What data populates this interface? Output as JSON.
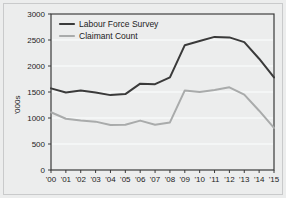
{
  "chart_data": {
    "type": "line",
    "title": "",
    "xlabel": "",
    "ylabel": "'000s",
    "ylim": [
      0,
      3000
    ],
    "yticks": [
      0,
      500,
      1000,
      1500,
      2000,
      2500,
      3000
    ],
    "ytick_labels": [
      "0",
      "500",
      "1000",
      "1500",
      "2000",
      "2500",
      "3000"
    ],
    "grid": "horizontal",
    "legend_position": "top-left",
    "categories": [
      "'00",
      "'01",
      "'02",
      "'03",
      "'04",
      "'05",
      "'06",
      "'07",
      "'08",
      "'09",
      "'10",
      "'11",
      "'12",
      "'13",
      "'14",
      "'15"
    ],
    "x": [
      2000,
      2001,
      2002,
      2003,
      2004,
      2005,
      2006,
      2007,
      2008,
      2009,
      2010,
      2011,
      2012,
      2013,
      2014,
      2015
    ],
    "series": [
      {
        "name": "Labour Force Survey",
        "color": "#3a3a3a",
        "values": [
          1570,
          1490,
          1530,
          1490,
          1440,
          1460,
          1660,
          1650,
          1780,
          2400,
          2480,
          2560,
          2550,
          2460,
          2140,
          1780
        ]
      },
      {
        "name": "Claimant Count",
        "color": "#a9abab",
        "values": [
          1110,
          985,
          950,
          930,
          865,
          870,
          950,
          870,
          915,
          1530,
          1500,
          1540,
          1590,
          1450,
          1140,
          810
        ]
      }
    ]
  },
  "legend": {
    "items": [
      {
        "label": "Labour Force Survey",
        "color": "#3a3a3a"
      },
      {
        "label": "Claimant Count",
        "color": "#a9abab"
      }
    ]
  },
  "axes": {
    "y_axis_title": "'000s",
    "y_tick_labels": [
      "3000",
      "2500",
      "2000",
      "1500",
      "1000",
      "500",
      "0"
    ],
    "x_tick_labels": [
      "'00",
      "'01",
      "'02",
      "'03",
      "'04",
      "'05",
      "'06",
      "'07",
      "'08",
      "'09",
      "'10",
      "'11",
      "'12",
      "'13",
      "'14",
      "'15"
    ]
  },
  "style": {
    "background": "#eceded",
    "gridline_color": "#f7f8f8",
    "frame_color": "#3a3a3a",
    "text_color": "#1c1c1c"
  }
}
